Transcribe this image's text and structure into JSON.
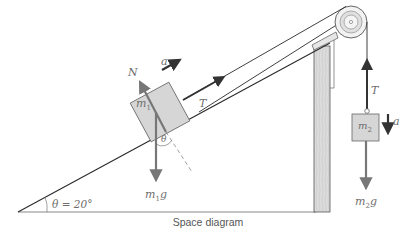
{
  "diagram": {
    "caption": "Space diagram",
    "angle_label": "θ = 20°",
    "incline_angle_deg": 20,
    "labels": {
      "normal": "N",
      "accel_m1": "a",
      "mass1": "m",
      "mass1_sub": "1",
      "tension_incline": "T",
      "theta_small": "θ",
      "weight1": "m",
      "weight1_sub": "1",
      "weight1_g": "g",
      "tension_vertical": "T",
      "mass2": "m",
      "mass2_sub": "2",
      "accel_m2": "a",
      "weight2": "m",
      "weight2_sub": "2",
      "weight2_g": "g"
    },
    "colors": {
      "line": "#2a2a2a",
      "force_arrow": "#777777",
      "block_fill": "#d6d6d6",
      "wood_fill": "#d9d9d9",
      "text": "#6e6e6e"
    }
  }
}
